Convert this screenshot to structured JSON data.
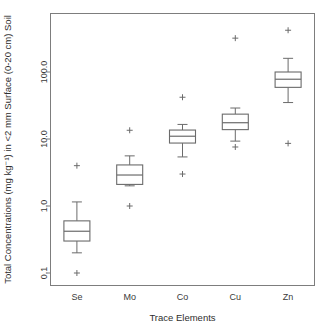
{
  "chart_data": {
    "type": "box",
    "title": "",
    "xlabel": "Trace Elements",
    "ylabel": "Total Concentrations (mg kg⁻¹) in <2 mm Surface (0-20 cm) Soil",
    "yscale": "log",
    "ylim": [
      0.07,
      900
    ],
    "ytick_values": [
      0.1,
      1.0,
      10.0,
      100.0
    ],
    "ytick_labels": [
      "0.1",
      "1.0",
      "10.0",
      "100.0"
    ],
    "grid": false,
    "legend": "none",
    "categories": [
      "Se",
      "Mo",
      "Co",
      "Cu",
      "Zn"
    ],
    "boxes": [
      {
        "name": "Se",
        "whisker_low": 0.2,
        "q1": 0.3,
        "median": 0.42,
        "q3": 0.6,
        "whisker_high": 1.15,
        "outliers": [
          0.1,
          4.0
        ]
      },
      {
        "name": "Mo",
        "whisker_low": 2.0,
        "q1": 2.1,
        "median": 2.9,
        "q3": 4.1,
        "whisker_high": 5.6,
        "outliers": [
          1.0,
          13.5
        ]
      },
      {
        "name": "Co",
        "whisker_low": 5.4,
        "q1": 8.7,
        "median": 11.0,
        "q3": 13.6,
        "whisker_high": 16.5,
        "outliers": [
          3.0,
          42.0
        ]
      },
      {
        "name": "Cu",
        "whisker_low": 9.3,
        "q1": 13.8,
        "median": 17.5,
        "q3": 23.5,
        "whisker_high": 29.0,
        "outliers": [
          7.6,
          320.0
        ]
      },
      {
        "name": "Zn",
        "whisker_low": 35.0,
        "q1": 59.0,
        "median": 78.0,
        "q3": 100.0,
        "whisker_high": 160.0,
        "outliers": [
          8.6,
          420.0
        ]
      }
    ]
  }
}
